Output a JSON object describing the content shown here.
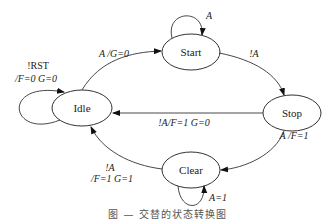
{
  "diagram": {
    "type": "state-machine",
    "states": [
      {
        "id": "idle",
        "label": "Idle"
      },
      {
        "id": "start",
        "label": "Start"
      },
      {
        "id": "stop",
        "label": "Stop"
      },
      {
        "id": "clear",
        "label": "Clear"
      }
    ],
    "transitions": [
      {
        "from": "idle",
        "to": "idle",
        "label_line1": "!RST",
        "label_line2": "/F=0  G=0"
      },
      {
        "from": "idle",
        "to": "start",
        "label": "A /G=0"
      },
      {
        "from": "start",
        "to": "start",
        "label": "A"
      },
      {
        "from": "start",
        "to": "stop",
        "label": "!A"
      },
      {
        "from": "stop",
        "to": "idle",
        "label": "!A/F=1  G=0"
      },
      {
        "from": "stop",
        "to": "clear",
        "label": "A /F=1"
      },
      {
        "from": "clear",
        "to": "clear",
        "label": "A=1"
      },
      {
        "from": "clear",
        "to": "idle",
        "label_line1": "!A",
        "label_line2": "/F=1  G=1"
      }
    ]
  },
  "caption": "图 —  交替的状态转换图"
}
